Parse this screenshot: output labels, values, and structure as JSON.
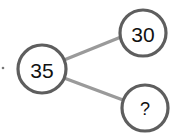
{
  "diagram": {
    "type": "number-bond",
    "whole": {
      "label": "35"
    },
    "parts": [
      {
        "label": "30"
      },
      {
        "label": "?"
      }
    ],
    "colors": {
      "ring": "#5e5e5e",
      "connector": "#9a9a9a",
      "text": "#111111"
    }
  }
}
